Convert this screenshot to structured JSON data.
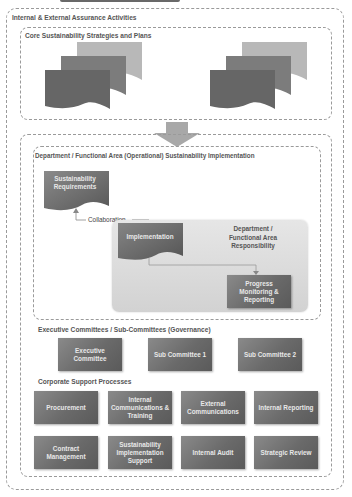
{
  "outer": {
    "title": "Internal & External Assurance Activities"
  },
  "core": {
    "title": "Core Sustainability Strategies and Plans",
    "doc_stacks": [
      {
        "icon": "document-stack-icon"
      },
      {
        "icon": "document-stack-icon"
      }
    ]
  },
  "department": {
    "title": "Department / Functional Area (Operational) Sustainability Implementation",
    "requirements": "Sustainability Requirements",
    "collaboration": "Collaboration",
    "implementation": "Implementation",
    "responsibility": "Department / Functional Area Responsibility",
    "progress": "Progress Monitoring & Reporting"
  },
  "executive": {
    "title": "Executive Committees / Sub-Committees (Governance)",
    "items": [
      "Executive Committee",
      "Sub Committee 1",
      "Sub Committee 2"
    ]
  },
  "support": {
    "title": "Corporate Support Processes",
    "items": [
      "Procurement",
      "Internal Communications & Training",
      "External Communications",
      "Internal Reporting",
      "Contract Management",
      "Sustainability Implementation Support",
      "Internal Audit",
      "Strategic Review"
    ]
  },
  "colors": {
    "box_dark": "#666666",
    "doc_back": "#b8b8b8",
    "doc_mid": "#7a7a7a",
    "doc_front": "#6a6a6a",
    "responsibility_bg": "#dcdcdc",
    "dash": "#9a9a9a"
  }
}
